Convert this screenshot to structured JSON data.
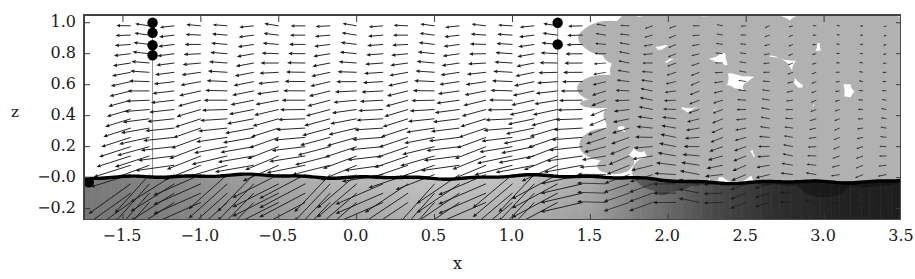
{
  "chart_data": {
    "type": "quiver",
    "title": "",
    "xlabel": "x",
    "ylabel": "z",
    "xlim": [
      -1.75,
      3.5
    ],
    "ylim": [
      1.05,
      -0.28
    ],
    "y_inverted": true,
    "grid": false,
    "legend": null,
    "xticks": [
      "−1.5",
      "−1.0",
      "−0.5",
      "0.0",
      "0.5",
      "1.0",
      "1.5",
      "2.0",
      "2.5",
      "3.0",
      "3.5"
    ],
    "xtick_values": [
      -1.5,
      -1.0,
      -0.5,
      0.0,
      0.5,
      1.0,
      1.5,
      2.0,
      2.5,
      3.0,
      3.5
    ],
    "yticks": [
      "−0.2",
      "−0.0",
      "0.2",
      "0.4",
      "0.6",
      "0.8",
      "1.0"
    ],
    "ytick_values": [
      -0.2,
      0.0,
      0.2,
      0.4,
      0.6,
      0.8,
      1.0
    ],
    "background_field": {
      "description": "grayscale scalar field, light in mid-left, dark at right",
      "colormap": "gray",
      "samples_x": [
        -1.75,
        -1.3,
        -0.9,
        -0.5,
        -0.1,
        0.3,
        0.7,
        1.1,
        1.5,
        1.9,
        2.3,
        2.7,
        3.1,
        3.5
      ],
      "surface_gray": [
        122,
        132,
        150,
        168,
        182,
        192,
        196,
        190,
        172,
        120,
        74,
        46,
        34,
        30
      ],
      "bottom_gray": [
        118,
        124,
        138,
        152,
        163,
        171,
        174,
        170,
        156,
        114,
        72,
        46,
        34,
        30
      ]
    },
    "interface_line": {
      "label": "free surface",
      "color": "#000000",
      "linewidth": 3.4,
      "x": [
        -1.75,
        -1.45,
        -1.15,
        -0.85,
        -0.55,
        -0.25,
        0.05,
        0.35,
        0.65,
        0.95,
        1.25,
        1.55,
        1.75,
        1.95,
        2.25,
        2.55,
        2.85,
        3.15,
        3.5
      ],
      "z": [
        -0.005,
        0.0,
        0.012,
        0.015,
        0.012,
        0.008,
        0.0,
        -0.004,
        0.0,
        0.006,
        0.012,
        0.01,
        0.0,
        -0.022,
        -0.028,
        -0.03,
        -0.03,
        -0.026,
        -0.018
      ]
    },
    "markers": {
      "label": "probe points",
      "color": "#000000",
      "size": 5.2,
      "points": [
        {
          "x": -1.72,
          "z": -0.03
        },
        {
          "x": -1.31,
          "z": 0.79
        },
        {
          "x": -1.31,
          "z": 0.855
        },
        {
          "x": -1.31,
          "z": 0.935
        },
        {
          "x": -1.31,
          "z": 1.0
        },
        {
          "x": 1.29,
          "z": 0.86
        },
        {
          "x": 1.29,
          "z": 1.0
        }
      ]
    },
    "vectors": {
      "description": "velocity vectors, mostly leftward/up-left, strongest near surface on left half",
      "color": "#1c1c1c",
      "columns_x": [
        -1.45,
        -1.33,
        -1.17,
        -1.0,
        -0.83,
        -0.66,
        -0.5,
        -0.33,
        -0.17,
        0.0,
        0.17,
        0.33,
        0.5,
        0.66,
        0.83,
        1.0,
        1.14,
        1.29,
        1.45,
        1.6,
        1.75,
        1.9,
        2.05,
        2.2,
        2.35,
        2.5,
        2.65,
        2.8,
        2.95,
        3.1,
        3.25,
        3.4
      ],
      "rows_z": [
        -0.16,
        -0.1,
        -0.04,
        0.02,
        0.08,
        0.14,
        0.2,
        0.26,
        0.32,
        0.38,
        0.44,
        0.5,
        0.56,
        0.62,
        0.68,
        0.74,
        0.8,
        0.86,
        0.92,
        0.98
      ]
    }
  },
  "axes": {
    "x_axis_label": "x",
    "y_axis_label": "z"
  }
}
